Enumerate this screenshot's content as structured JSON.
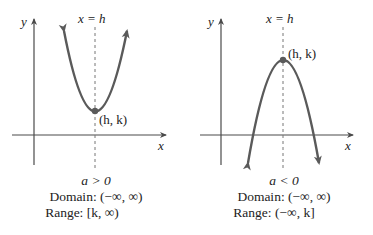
{
  "colors": {
    "axis": "#4a4a4a",
    "curve": "#5a5a5a",
    "dashed": "#777777",
    "text": "#222222"
  },
  "panels": [
    {
      "id": "upward",
      "axis_labels": {
        "y": "y",
        "x": "x"
      },
      "symmetry_label": "x = h",
      "vertex_label": "(h, k)",
      "condition": "a > 0",
      "domain": "Domain: (−∞, ∞)",
      "range": "Range: [k, ∞)"
    },
    {
      "id": "downward",
      "axis_labels": {
        "y": "y",
        "x": "x"
      },
      "symmetry_label": "x = h",
      "vertex_label": "(h, k)",
      "condition": "a < 0",
      "domain": "Domain: (−∞, ∞)",
      "range": "Range: (−∞, k]"
    }
  ]
}
